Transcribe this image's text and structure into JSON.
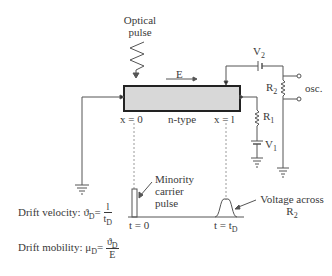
{
  "diagram": {
    "optical_pulse": {
      "line1": "Optical",
      "line2": "pulse"
    },
    "field_label": "E",
    "sample": {
      "label": "n-type",
      "fill": "#d8d8d8",
      "border": "#222222"
    },
    "positions": {
      "left": "x = 0",
      "right": "x = l"
    },
    "components": {
      "V2": {
        "main": "V",
        "sub": "2"
      },
      "R2": {
        "main": "R",
        "sub": "2"
      },
      "R1": {
        "main": "R",
        "sub": "1"
      },
      "V1": {
        "main": "V",
        "sub": "1"
      },
      "osc": "osc."
    },
    "waveform": {
      "minority_label": {
        "line1": "Minority",
        "line2": "carrier",
        "line3": "pulse"
      },
      "t0": "t = 0",
      "tD": {
        "main": "t = t",
        "sub": "D"
      },
      "voltage_label": {
        "line1": "Voltage across",
        "line2_main": "R",
        "line2_sub": "2"
      }
    },
    "equations": {
      "drift_velocity": {
        "label": "Drift velocity:",
        "lhs": "ϑ",
        "lhs_sub": "D",
        "eq": "=",
        "num": "l",
        "den": "t",
        "den_sub": "D"
      },
      "drift_mobility": {
        "label": "Drift mobility:",
        "lhs": "μ",
        "lhs_sub": "D",
        "eq": "=",
        "num": "ϑ",
        "num_sub": "D",
        "den": "E"
      }
    },
    "colors": {
      "line": "#555555",
      "dotted": "#9a9a9a",
      "text": "#3a3a3a"
    }
  }
}
